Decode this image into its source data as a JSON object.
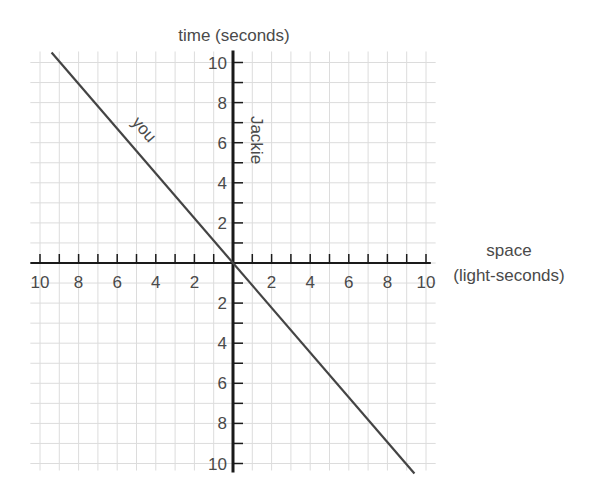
{
  "chart_data": {
    "type": "line",
    "title": "",
    "xlabel": "space (light-seconds)",
    "xlabel_lines": [
      "space",
      "(light-seconds)"
    ],
    "ylabel": "time (seconds)",
    "xlim": [
      -10,
      10
    ],
    "ylim": [
      -10,
      10
    ],
    "grid": true,
    "x_tick_labels": [
      "10",
      "8",
      "6",
      "4",
      "2",
      "",
      "2",
      "4",
      "6",
      "8",
      "10"
    ],
    "x_tick_values": [
      -10,
      -8,
      -6,
      -4,
      -2,
      0,
      2,
      4,
      6,
      8,
      10
    ],
    "y_tick_labels_upper": [
      "10",
      "8",
      "6",
      "4",
      "2"
    ],
    "y_tick_labels_lower": [
      "2",
      "4",
      "6",
      "8",
      "10"
    ],
    "series": [
      {
        "name": "you",
        "x": [
          -9.4,
          9.4
        ],
        "y": [
          10.5,
          -10.5
        ],
        "color": "#444444"
      },
      {
        "name": "Jackie",
        "x": [
          0,
          0
        ],
        "y": [
          -10.5,
          10.5
        ],
        "color": "#111111"
      }
    ],
    "annotations": [
      {
        "text": "you",
        "near": "upper-left segment of diagonal line",
        "rotation_deg": 49
      },
      {
        "text": "Jackie",
        "near": "positive time axis",
        "rotation_deg": 90
      }
    ]
  },
  "labels": {
    "time_axis": "time (seconds)",
    "space_axis_line1": "space",
    "space_axis_line2": "(light-seconds)",
    "you": "you",
    "jackie": "Jackie"
  },
  "colors": {
    "grid": "#dcdcdc",
    "axis": "#1a1a1a",
    "worldline": "#4a4a4a",
    "text": "#4a4a4a"
  }
}
